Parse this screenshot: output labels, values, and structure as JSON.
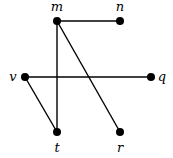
{
  "graph": {
    "nodes": [
      {
        "id": "m",
        "label": "m",
        "x": 57,
        "y": 21,
        "lx": 57,
        "ly": 11,
        "anchor": "middle"
      },
      {
        "id": "n",
        "label": "n",
        "x": 120,
        "y": 21,
        "lx": 120,
        "ly": 11,
        "anchor": "middle"
      },
      {
        "id": "v",
        "label": "v",
        "x": 25,
        "y": 77,
        "lx": 13,
        "ly": 81,
        "anchor": "middle"
      },
      {
        "id": "q",
        "label": "q",
        "x": 151,
        "y": 77,
        "lx": 162,
        "ly": 81,
        "anchor": "middle"
      },
      {
        "id": "t",
        "label": "t",
        "x": 57,
        "y": 132,
        "lx": 57,
        "ly": 152,
        "anchor": "middle"
      },
      {
        "id": "r",
        "label": "r",
        "x": 120,
        "y": 132,
        "lx": 120,
        "ly": 152,
        "anchor": "middle"
      }
    ],
    "edges": [
      {
        "from": "m",
        "to": "n"
      },
      {
        "from": "m",
        "to": "t"
      },
      {
        "from": "m",
        "to": "r"
      },
      {
        "from": "v",
        "to": "q"
      },
      {
        "from": "v",
        "to": "t"
      }
    ],
    "colors": {
      "node": "#000000",
      "edge": "#000000",
      "background": "#ffffff"
    }
  }
}
